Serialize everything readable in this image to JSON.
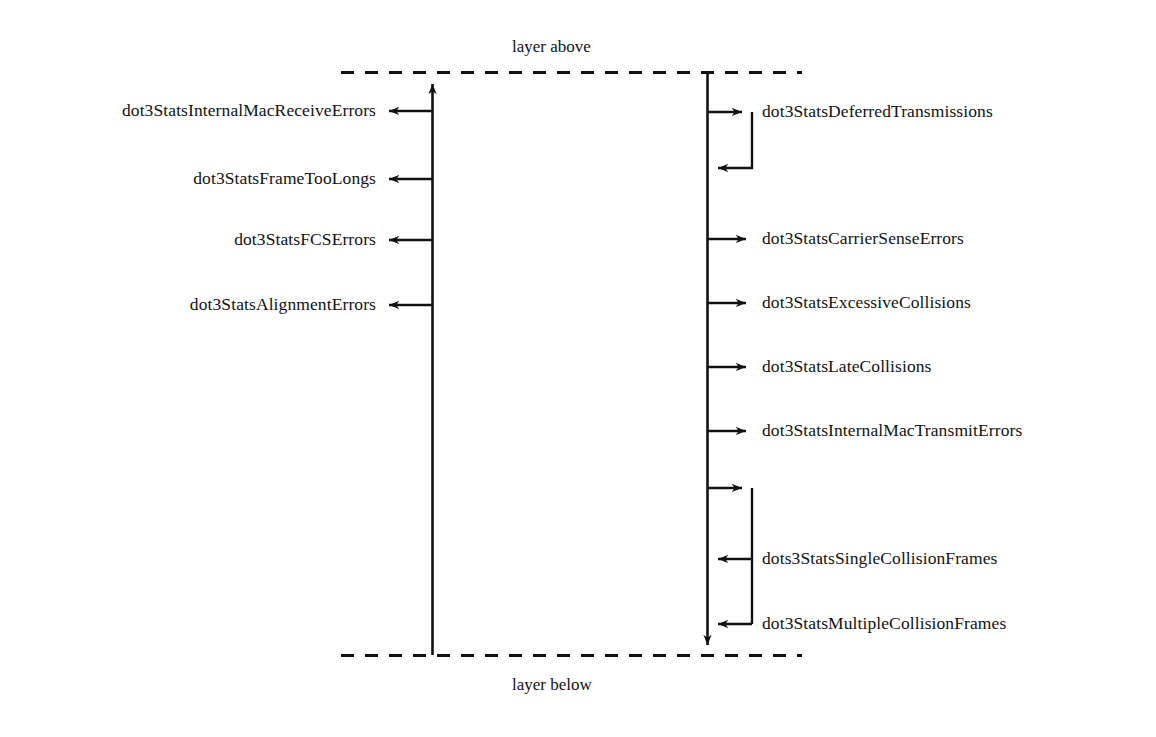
{
  "diagram": {
    "stroke_color": "#111111",
    "background_color": "#ffffff",
    "boundaries": {
      "top_label": "layer above",
      "bottom_label": "layer below",
      "line_style": "dashed"
    },
    "receive_side": {
      "direction": "upward",
      "note": "arrows point left from the receive vertical line",
      "items": [
        {
          "label": "dot3StatsInternalMacReceiveErrors",
          "y": 111
        },
        {
          "label": "dot3StatsFrameTooLongs",
          "y": 179
        },
        {
          "label": "dot3StatsFCSErrors",
          "y": 240
        },
        {
          "label": "dot3StatsAlignmentErrors",
          "y": 305
        }
      ]
    },
    "transmit_side": {
      "direction": "downward",
      "note": "arrows point right from the transmit vertical line; loops return to the line",
      "items": [
        {
          "label": "dot3StatsDeferredTransmissions",
          "y": 112,
          "kind": "loop-out"
        },
        {
          "label": "dot3StatsCarrierSenseErrors",
          "y": 239,
          "kind": "arrow"
        },
        {
          "label": "dot3StatsExcessiveCollisions",
          "y": 303,
          "kind": "arrow"
        },
        {
          "label": "dot3StatsLateCollisions",
          "y": 367,
          "kind": "arrow"
        },
        {
          "label": "dot3StatsInternalMacTransmitErrors",
          "y": 431,
          "kind": "arrow"
        },
        {
          "label": "dots3StatsSingleCollisionFrames",
          "y": 559,
          "kind": "loop-back"
        },
        {
          "label": "dot3StatsMultipleCollisionFrames",
          "y": 624,
          "kind": "loop-back"
        }
      ]
    }
  }
}
